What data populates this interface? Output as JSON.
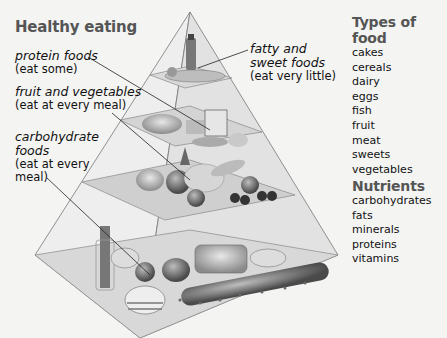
{
  "title": "Healthy eating",
  "labels": {
    "protein": {
      "name": "protein foods",
      "advice": "(eat some)"
    },
    "fruitveg": {
      "name": "fruit and vegetables",
      "advice": "(eat at every meal)"
    },
    "carb": {
      "name_line1": "carbohydrate",
      "name_line2": "foods",
      "advice_line1": "(eat at every",
      "advice_line2": "meal)"
    },
    "fatty": {
      "name_line1": "fatty and",
      "name_line2": "sweet foods",
      "advice": "(eat very little)"
    }
  },
  "types_of_food": {
    "heading": "Types of food",
    "items": [
      "cakes",
      "cereals",
      "dairy",
      "eggs",
      "fish",
      "fruit",
      "meat",
      "sweets",
      "vegetables"
    ]
  },
  "nutrients": {
    "heading": "Nutrients",
    "items": [
      "carbohydrates",
      "fats",
      "minerals",
      "proteins",
      "vitamins"
    ]
  },
  "diagram": {
    "type": "food-pyramid",
    "tiers": [
      {
        "level": 1,
        "group": "fatty and sweet foods",
        "advice": "eat very little"
      },
      {
        "level": 2,
        "group": "protein foods",
        "advice": "eat some"
      },
      {
        "level": 3,
        "group": "fruit and vegetables",
        "advice": "eat at every meal"
      },
      {
        "level": 4,
        "group": "carbohydrate foods",
        "advice": "eat at every meal"
      }
    ]
  }
}
